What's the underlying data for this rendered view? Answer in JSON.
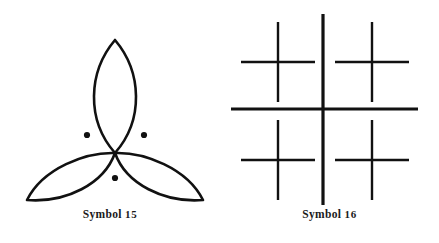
{
  "plate": {
    "background_color": "#ffffff",
    "ink_color": "#111111",
    "width": 439,
    "height": 243
  },
  "figures": [
    {
      "id": "symbol-15",
      "caption_label": "Symbol",
      "caption_number": "15",
      "caption_full": "Symbol 15",
      "glyph_name": "trefoil-three-petals-with-three-dots",
      "description": "Three pointed petal (vesica) lobes radiating from a common center, with three small filled dots between the lobes",
      "stroke_color": "#111111",
      "stroke_width": 2.6,
      "center": {
        "x": 115,
        "y": 153
      },
      "petals": [
        {
          "name": "petal-top",
          "tip_x": 115,
          "tip_y": 40,
          "angle_deg": -90
        },
        {
          "name": "petal-lower-left",
          "tip_x": 27,
          "tip_y": 200,
          "angle_deg": 150
        },
        {
          "name": "petal-lower-right",
          "tip_x": 203,
          "tip_y": 200,
          "angle_deg": 30
        }
      ],
      "dots": [
        {
          "name": "dot-left",
          "x": 87,
          "y": 135,
          "r": 3.1
        },
        {
          "name": "dot-right",
          "x": 144,
          "y": 135,
          "r": 3.1
        },
        {
          "name": "dot-bottom",
          "x": 115,
          "y": 178,
          "r": 3.1
        }
      ]
    },
    {
      "id": "symbol-16",
      "caption_label": "Symbol",
      "caption_number": "16",
      "caption_full": "Symbol 16",
      "glyph_name": "large-cross-with-four-quadrant-crosses",
      "description": "One large plus sign with a smaller plus sign centered in each of its four quadrants",
      "stroke_color": "#111111",
      "main_cross": {
        "name": "main-cross",
        "center_x": 323,
        "center_y": 109,
        "h_x1": 231,
        "h_x2": 418,
        "v_y1": 14,
        "v_y2": 205,
        "stroke_width": 3.2
      },
      "small_crosses": [
        {
          "name": "small-cross-top-left",
          "center_x": 278,
          "center_y": 62,
          "half_w": 37,
          "half_h": 40,
          "stroke_width": 2.4
        },
        {
          "name": "small-cross-top-right",
          "center_x": 372,
          "center_y": 62,
          "half_w": 37,
          "half_h": 40,
          "stroke_width": 2.4
        },
        {
          "name": "small-cross-bottom-left",
          "center_x": 278,
          "center_y": 160,
          "half_w": 37,
          "half_h": 40,
          "stroke_width": 2.4
        },
        {
          "name": "small-cross-bottom-right",
          "center_x": 372,
          "center_y": 160,
          "half_w": 37,
          "half_h": 40,
          "stroke_width": 2.4
        }
      ]
    }
  ]
}
